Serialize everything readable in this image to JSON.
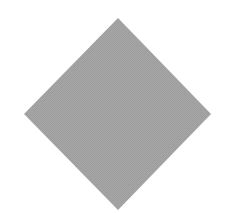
{
  "diagram": {
    "shapes": [
      {
        "id": "diamond",
        "kind": "diamond",
        "fill": "#a4a4a4",
        "texture": "halftone-noise",
        "label": ""
      }
    ]
  },
  "colors": {
    "background": "#ffffff",
    "shape_fill": "#a4a4a4",
    "shape_edge": "#9a9a9a"
  }
}
